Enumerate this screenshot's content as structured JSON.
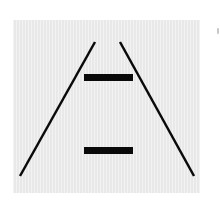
{
  "figure": {
    "name": "Ponzo illusion",
    "description": "Two converging oblique lines with two identical horizontal bars, one near the apex and one near the base",
    "colors": {
      "background": "#ffffff",
      "panel": "#ececec",
      "ink": "#0a0a0a",
      "edge_mark": "#c8c8c8"
    },
    "converging_lines": [
      {
        "id": "left-rail",
        "x1": 95,
        "y1": 42,
        "x2": 20,
        "y2": 176,
        "stroke_width": 2.5
      },
      {
        "id": "right-rail",
        "x1": 120,
        "y1": 42,
        "x2": 194,
        "y2": 176,
        "stroke_width": 2.5
      }
    ],
    "bars": [
      {
        "id": "upper-bar",
        "x": 84,
        "y": 74,
        "width": 49,
        "height": 7
      },
      {
        "id": "lower-bar",
        "x": 84,
        "y": 147,
        "width": 49,
        "height": 7
      }
    ]
  }
}
